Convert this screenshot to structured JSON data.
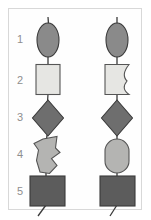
{
  "figure": {
    "title": "",
    "frame": {
      "x": 8,
      "y": 8,
      "width": 134,
      "height": 202,
      "border_color": "#d8d8d8"
    },
    "background_color": "#ffffff",
    "row_labels": [
      "1",
      "2",
      "3",
      "4",
      "5"
    ],
    "row_label_color": "#8e8e8e",
    "row_label_x": 20,
    "row_label_y": [
      40,
      81,
      118,
      155,
      192
    ],
    "columns": [
      {
        "name": "left-chain",
        "center_x": 48,
        "connector_color": "#3a3a3a",
        "shapes": [
          {
            "row": 1,
            "shape": "ellipse",
            "label": "ellipse-vertical",
            "fill": "#8a8a8a",
            "stroke": "#3a3a3a",
            "cx": 48,
            "cy": 40,
            "rx": 11,
            "ry": 17
          },
          {
            "row": 2,
            "shape": "rectangle",
            "label": "rectangle-square",
            "fill": "#e6e6e3",
            "stroke": "#555555",
            "x": 36,
            "y": 64,
            "width": 24,
            "height": 31
          },
          {
            "row": 3,
            "shape": "diamond",
            "label": "diamond-rhombus",
            "fill": "#6e6e6e",
            "stroke": "#3a3a3a",
            "cx": 48,
            "cy": 118,
            "rx": 16,
            "ry": 18
          },
          {
            "row": 4,
            "shape": "polygon-irregular",
            "label": "irregular-notched-polygon",
            "fill": "#b4b4b2",
            "stroke": "#555555",
            "points": "42,138 57,135 56,147 60,152 52,159 57,166 50,174 40,172 36,160 38,150 34,144"
          },
          {
            "row": 5,
            "shape": "rectangle",
            "label": "rectangle-dark-square",
            "fill": "#5c5c5c",
            "stroke": "#3a3a3a",
            "x": 30,
            "y": 175,
            "width": 35,
            "height": 31
          }
        ],
        "connectors": [
          {
            "x1": 48,
            "y1": 18,
            "x2": 48,
            "y2": 23
          },
          {
            "x1": 48,
            "y1": 57,
            "x2": 48,
            "y2": 64
          },
          {
            "x1": 48,
            "y1": 95,
            "x2": 47,
            "y2": 101
          },
          {
            "x1": 47,
            "y1": 136,
            "x2": 46,
            "y2": 138
          },
          {
            "x1": 46,
            "y1": 172,
            "x2": 46,
            "y2": 176
          },
          {
            "x1": 46,
            "y1": 206,
            "x2": 38,
            "y2": 216
          }
        ]
      },
      {
        "name": "right-chain",
        "center_x": 117,
        "connector_color": "#3a3a3a",
        "shapes": [
          {
            "row": 1,
            "shape": "ellipse",
            "label": "ellipse-vertical",
            "fill": "#8a8a8a",
            "stroke": "#3a3a3a",
            "cx": 117,
            "cy": 40,
            "rx": 11,
            "ry": 17
          },
          {
            "row": 2,
            "shape": "wavy-rectangle",
            "label": "rectangle-concave-right-edge",
            "fill": "#e6e6e3",
            "stroke": "#555555",
            "x": 105,
            "y": 64,
            "width": 24,
            "height": 31
          },
          {
            "row": 3,
            "shape": "diamond",
            "label": "diamond-rhombus",
            "fill": "#6e6e6e",
            "stroke": "#3a3a3a",
            "cx": 117,
            "cy": 118,
            "rx": 16,
            "ry": 18
          },
          {
            "row": 4,
            "shape": "stadium",
            "label": "rounded-rectangle-stadium",
            "fill": "#b4b4b2",
            "stroke": "#555555",
            "x": 105,
            "y": 138,
            "width": 24,
            "height": 36,
            "radius": 12
          },
          {
            "row": 5,
            "shape": "rectangle",
            "label": "rectangle-dark-square",
            "fill": "#5c5c5c",
            "stroke": "#3a3a3a",
            "x": 100,
            "y": 175,
            "width": 35,
            "height": 31
          }
        ],
        "connectors": [
          {
            "x1": 117,
            "y1": 18,
            "x2": 117,
            "y2": 23
          },
          {
            "x1": 117,
            "y1": 57,
            "x2": 117,
            "y2": 64
          },
          {
            "x1": 117,
            "y1": 95,
            "x2": 117,
            "y2": 101
          },
          {
            "x1": 117,
            "y1": 136,
            "x2": 117,
            "y2": 138
          },
          {
            "x1": 117,
            "y1": 174,
            "x2": 117,
            "y2": 176
          },
          {
            "x1": 117,
            "y1": 206,
            "x2": 110,
            "y2": 216
          }
        ]
      }
    ]
  }
}
